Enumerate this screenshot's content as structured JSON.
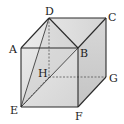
{
  "figure": {
    "type": "cube",
    "vertices": {
      "A": {
        "label": "A",
        "x": 21,
        "y": 48
      },
      "B": {
        "label": "B",
        "x": 78,
        "y": 48
      },
      "C": {
        "label": "C",
        "x": 106,
        "y": 18
      },
      "D": {
        "label": "D",
        "x": 49,
        "y": 18
      },
      "E": {
        "label": "E",
        "x": 21,
        "y": 107
      },
      "F": {
        "label": "F",
        "x": 78,
        "y": 107
      },
      "G": {
        "label": "G",
        "x": 106,
        "y": 77
      },
      "H": {
        "label": "H",
        "x": 49,
        "y": 77
      }
    },
    "solid_edges": [
      "AB",
      "BF",
      "FE",
      "EA",
      "AD",
      "DC",
      "CB",
      "CG",
      "GF",
      "DB",
      "DE",
      "EB"
    ],
    "hidden_edges": [
      "DH",
      "HG",
      "HE"
    ],
    "colors": {
      "edge": "#2a2a2a",
      "hidden_edge": "#555555",
      "front_face": "#dcdcdc",
      "top_face": "#e6e6e6",
      "right_face": "#cfcfcf"
    }
  }
}
